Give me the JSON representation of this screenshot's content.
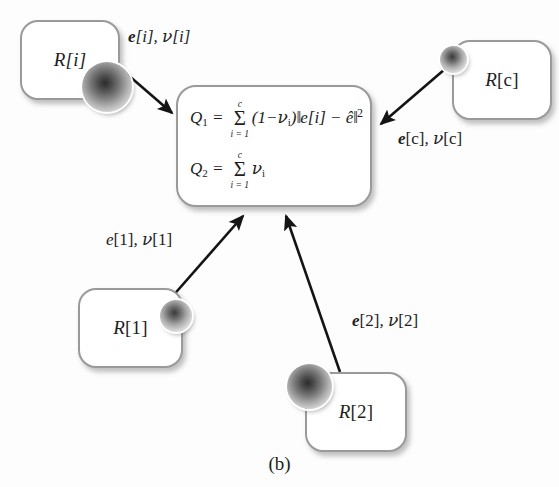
{
  "figure": {
    "caption": "(b)",
    "colors": {
      "box_border": "#9a9a9a",
      "arrow": "#1a1a1a",
      "text": "#1d1d1d",
      "background": "#fdfdfd"
    }
  },
  "center": {
    "name": "objective-functions-box",
    "q1": {
      "lhs": "Q",
      "lhs_sub": "1",
      "eq": "=",
      "sum_symbol": "Σ",
      "sum_upper": "c",
      "sum_lower": "i = 1",
      "body_open": "(1−",
      "nu": "ν",
      "nu_sub": "i",
      "body_close": ")",
      "norm_open": "‖",
      "norm_body": "e[i] − ê",
      "norm_close": "‖",
      "exponent": "2"
    },
    "q2": {
      "lhs": "Q",
      "lhs_sub": "2",
      "eq": "=",
      "sum_symbol": "Σ",
      "sum_upper": "c",
      "sum_lower": "i = 1",
      "nu": "ν",
      "nu_sub": "i"
    }
  },
  "nodes": [
    {
      "id": "R-i",
      "label_r": "R",
      "label_idx": "[i]",
      "idx_style": "italic"
    },
    {
      "id": "R-c",
      "label_r": "R",
      "label_idx": "[c]",
      "idx_style": "upright"
    },
    {
      "id": "R-1",
      "label_r": "R",
      "label_idx": "[1]",
      "idx_style": "upright"
    },
    {
      "id": "R-2",
      "label_r": "R",
      "label_idx": "[2]",
      "idx_style": "upright"
    }
  ],
  "edges": [
    {
      "id": "edge-i",
      "from": "R-i",
      "to": "center",
      "e": "e",
      "e_idx": "[i]",
      "sep": ", ",
      "nu": "ν",
      "nu_idx": "[i]",
      "bold_e": true
    },
    {
      "id": "edge-c",
      "from": "R-c",
      "to": "center",
      "e": "e",
      "e_idx": "[c]",
      "sep": ", ",
      "nu": "ν",
      "nu_idx": "[c]",
      "bold_e": true
    },
    {
      "id": "edge-1",
      "from": "R-1",
      "to": "center",
      "e": "e",
      "e_idx": "[1]",
      "sep": ", ",
      "nu": "ν",
      "nu_idx": "[1]",
      "bold_e": false
    },
    {
      "id": "edge-2",
      "from": "R-2",
      "to": "center",
      "e": "e",
      "e_idx": "[2]",
      "sep": ", ",
      "nu": "ν",
      "nu_idx": "[2]",
      "bold_e": true
    }
  ]
}
